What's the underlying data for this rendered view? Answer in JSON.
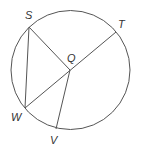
{
  "diagram": {
    "type": "circle-geometry",
    "stroke_color": "#555555",
    "label_color": "#333333",
    "circle": {
      "center": "Q",
      "cx": 70.5,
      "cy": 70,
      "r": 59.5
    },
    "points": {
      "S": {
        "x": 29,
        "y": 27,
        "label": "S",
        "lx": 25,
        "ly": 19
      },
      "T": {
        "x": 116,
        "y": 32,
        "label": "T",
        "lx": 118,
        "ly": 28
      },
      "Q": {
        "x": 70,
        "y": 70,
        "label": "Q",
        "lx": 67,
        "ly": 62
      },
      "W": {
        "x": 25,
        "y": 108,
        "label": "W",
        "lx": 12,
        "ly": 121
      },
      "V": {
        "x": 56,
        "y": 129,
        "label": "V",
        "lx": 50,
        "ly": 144
      }
    },
    "segments": [
      {
        "from": "S",
        "to": "Q",
        "name": "radius-SQ"
      },
      {
        "from": "S",
        "to": "W",
        "name": "chord-SW"
      },
      {
        "from": "W",
        "to": "T",
        "name": "diameter-WT"
      },
      {
        "from": "Q",
        "to": "V",
        "name": "radius-QV"
      }
    ],
    "labels": {
      "S": "S",
      "T": "T",
      "Q": "Q",
      "W": "W",
      "V": "V"
    }
  }
}
